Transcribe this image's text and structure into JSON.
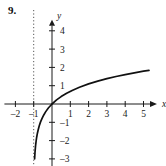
{
  "figure": {
    "number_label": "9.",
    "background_color": "#ffffff",
    "ink_color": "#1a1a1a"
  },
  "chart_data": {
    "type": "line",
    "title": "",
    "xlabel": "x",
    "ylabel": "y",
    "xlim": [
      -2.6,
      5.9
    ],
    "ylim": [
      -3.4,
      4.6
    ],
    "grid": false,
    "legend": null,
    "xticks": [
      -2,
      -1,
      1,
      2,
      3,
      4,
      5
    ],
    "xtick_labels": [
      "-2",
      "-1",
      "1",
      "2",
      "3",
      "4",
      "5"
    ],
    "yticks": [
      -3,
      -2,
      -1,
      1,
      2,
      3,
      4
    ],
    "ytick_labels": [
      "-3",
      "-2",
      "-1",
      "1",
      "2",
      "3",
      "4"
    ],
    "series": [
      {
        "name": "y = ln(x + 1)",
        "style": "solid",
        "color": "#111111",
        "x": [
          -0.95,
          -0.93,
          -0.9,
          -0.87,
          -0.84,
          -0.8,
          -0.75,
          -0.7,
          -0.63,
          -0.55,
          -0.45,
          -0.35,
          -0.2,
          0,
          0.25,
          0.5,
          0.8,
          1.1,
          1.5,
          2,
          2.5,
          3,
          3.5,
          4,
          4.5,
          5,
          5.3
        ],
        "y": [
          -3.0,
          -2.66,
          -2.3,
          -2.04,
          -1.83,
          -1.61,
          -1.39,
          -1.2,
          -0.99,
          -0.8,
          -0.6,
          -0.43,
          -0.22,
          0,
          0.223,
          0.405,
          0.588,
          0.742,
          0.916,
          1.099,
          1.253,
          1.386,
          1.504,
          1.609,
          1.705,
          1.792,
          1.841
        ]
      }
    ],
    "annotations": [
      {
        "kind": "vertical-asymptote",
        "label": "x = -1",
        "x": -1,
        "style": "dotted",
        "color": "#555555"
      }
    ],
    "curve_endpoints": {
      "left_bottom": {
        "x": -0.95,
        "y": -3.0
      },
      "right_top": {
        "x": 5.3,
        "y": 1.84
      }
    }
  }
}
